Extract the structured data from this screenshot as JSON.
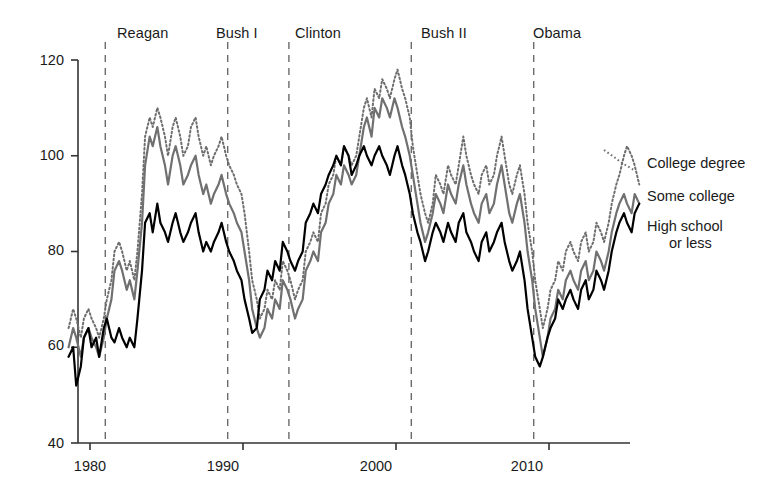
{
  "chart_data": {
    "type": "line",
    "title": "",
    "xlabel": "",
    "ylabel": "",
    "xlim": [
      1978.6,
      2016.8
    ],
    "ylim": [
      40,
      120
    ],
    "grid": false,
    "legend_position": "right",
    "x_ticks": [
      "1980",
      "1990",
      "2000",
      "2010"
    ],
    "x_tick_values": [
      1980,
      1990,
      2000,
      2010
    ],
    "y_ticks": [
      "40",
      "60",
      "80",
      "100",
      "120"
    ],
    "y_tick_values": [
      40,
      60,
      80,
      100,
      120
    ],
    "annotations": [
      {
        "label": "Reagan",
        "x": 1981.0,
        "label_x": 1984.3
      },
      {
        "label": "Bush I",
        "x": 1989.0,
        "label_x": 1990.9
      },
      {
        "label": "Clinton",
        "x": 1993.0,
        "label_x": 1996.2
      },
      {
        "label": "Bush II",
        "x": 2001.0,
        "label_x": 2004.0
      },
      {
        "label": "Obama",
        "x": 2009.0,
        "label_x": 2012.0
      }
    ],
    "series": [
      {
        "name": "College degree",
        "style": "dotted",
        "color": "#6e6e6e",
        "x": [
          1978.6,
          1978.9,
          1979.1,
          1979.4,
          1979.6,
          1979.9,
          1980.1,
          1980.4,
          1980.6,
          1980.9,
          1981.1,
          1981.4,
          1981.6,
          1981.9,
          1982.1,
          1982.4,
          1982.6,
          1982.9,
          1983.1,
          1983.4,
          1983.6,
          1983.9,
          1984.1,
          1984.4,
          1984.6,
          1984.9,
          1985.1,
          1985.4,
          1985.6,
          1985.9,
          1986.1,
          1986.4,
          1986.6,
          1986.9,
          1987.1,
          1987.4,
          1987.6,
          1987.9,
          1988.1,
          1988.4,
          1988.6,
          1988.9,
          1989.1,
          1989.4,
          1989.6,
          1989.9,
          1990.1,
          1990.4,
          1990.6,
          1990.9,
          1991.1,
          1991.4,
          1991.6,
          1991.9,
          1992.1,
          1992.4,
          1992.6,
          1992.9,
          1993.1,
          1993.4,
          1993.6,
          1993.9,
          1994.1,
          1994.4,
          1994.6,
          1994.9,
          1995.1,
          1995.4,
          1995.6,
          1995.9,
          1996.1,
          1996.4,
          1996.6,
          1996.9,
          1997.1,
          1997.4,
          1997.6,
          1997.9,
          1998.1,
          1998.4,
          1998.6,
          1998.9,
          1999.1,
          1999.4,
          1999.6,
          1999.9,
          2000.1,
          2000.4,
          2000.6,
          2000.9,
          2001.1,
          2001.4,
          2001.6,
          2001.9,
          2002.1,
          2002.4,
          2002.6,
          2002.9,
          2003.1,
          2003.4,
          2003.6,
          2003.9,
          2004.1,
          2004.4,
          2004.6,
          2004.9,
          2005.1,
          2005.4,
          2005.6,
          2005.9,
          2006.1,
          2006.4,
          2006.6,
          2006.9,
          2007.1,
          2007.4,
          2007.6,
          2007.9,
          2008.1,
          2008.4,
          2008.6,
          2008.9,
          2009.1,
          2009.4,
          2009.6,
          2009.9,
          2010.1,
          2010.4,
          2010.6,
          2010.9,
          2011.1,
          2011.4,
          2011.6,
          2011.9,
          2012.1,
          2012.4,
          2012.6,
          2012.9,
          2013.1,
          2013.4,
          2013.6,
          2013.9,
          2014.1,
          2014.4,
          2014.6,
          2014.9,
          2015.1,
          2015.4,
          2015.6,
          2015.9
        ],
        "values": [
          64,
          68,
          66,
          62,
          66,
          68,
          66,
          64,
          62,
          66,
          70,
          74,
          80,
          82,
          80,
          76,
          78,
          74,
          80,
          92,
          104,
          108,
          106,
          110,
          108,
          104,
          100,
          106,
          108,
          104,
          100,
          102,
          106,
          108,
          104,
          100,
          102,
          98,
          100,
          102,
          104,
          100,
          98,
          96,
          94,
          92,
          88,
          80,
          74,
          70,
          66,
          68,
          72,
          70,
          74,
          72,
          78,
          76,
          74,
          70,
          72,
          74,
          80,
          82,
          84,
          82,
          88,
          90,
          94,
          96,
          100,
          98,
          102,
          100,
          98,
          100,
          104,
          110,
          112,
          108,
          114,
          112,
          116,
          114,
          112,
          116,
          118,
          114,
          112,
          108,
          102,
          96,
          92,
          88,
          86,
          90,
          96,
          94,
          92,
          98,
          96,
          94,
          98,
          104,
          100,
          96,
          94,
          92,
          96,
          98,
          94,
          96,
          100,
          104,
          100,
          94,
          92,
          96,
          98,
          92,
          86,
          80,
          74,
          68,
          64,
          68,
          72,
          74,
          78,
          76,
          80,
          82,
          80,
          78,
          82,
          84,
          80,
          82,
          86,
          84,
          82,
          86,
          90,
          94,
          96,
          100,
          102,
          100,
          98,
          94
        ]
      },
      {
        "name": "Some college",
        "style": "solid",
        "color": "#707070",
        "x": [
          1978.6,
          1978.9,
          1979.1,
          1979.4,
          1979.6,
          1979.9,
          1980.1,
          1980.4,
          1980.6,
          1980.9,
          1981.1,
          1981.4,
          1981.6,
          1981.9,
          1982.1,
          1982.4,
          1982.6,
          1982.9,
          1983.1,
          1983.4,
          1983.6,
          1983.9,
          1984.1,
          1984.4,
          1984.6,
          1984.9,
          1985.1,
          1985.4,
          1985.6,
          1985.9,
          1986.1,
          1986.4,
          1986.6,
          1986.9,
          1987.1,
          1987.4,
          1987.6,
          1987.9,
          1988.1,
          1988.4,
          1988.6,
          1988.9,
          1989.1,
          1989.4,
          1989.6,
          1989.9,
          1990.1,
          1990.4,
          1990.6,
          1990.9,
          1991.1,
          1991.4,
          1991.6,
          1991.9,
          1992.1,
          1992.4,
          1992.6,
          1992.9,
          1993.1,
          1993.4,
          1993.6,
          1993.9,
          1994.1,
          1994.4,
          1994.6,
          1994.9,
          1995.1,
          1995.4,
          1995.6,
          1995.9,
          1996.1,
          1996.4,
          1996.6,
          1996.9,
          1997.1,
          1997.4,
          1997.6,
          1997.9,
          1998.1,
          1998.4,
          1998.6,
          1998.9,
          1999.1,
          1999.4,
          1999.6,
          1999.9,
          2000.1,
          2000.4,
          2000.6,
          2000.9,
          2001.1,
          2001.4,
          2001.6,
          2001.9,
          2002.1,
          2002.4,
          2002.6,
          2002.9,
          2003.1,
          2003.4,
          2003.6,
          2003.9,
          2004.1,
          2004.4,
          2004.6,
          2004.9,
          2005.1,
          2005.4,
          2005.6,
          2005.9,
          2006.1,
          2006.4,
          2006.6,
          2006.9,
          2007.1,
          2007.4,
          2007.6,
          2007.9,
          2008.1,
          2008.4,
          2008.6,
          2008.9,
          2009.1,
          2009.4,
          2009.6,
          2009.9,
          2010.1,
          2010.4,
          2010.6,
          2010.9,
          2011.1,
          2011.4,
          2011.6,
          2011.9,
          2012.1,
          2012.4,
          2012.6,
          2012.9,
          2013.1,
          2013.4,
          2013.6,
          2013.9,
          2014.1,
          2014.4,
          2014.6,
          2014.9,
          2015.1,
          2015.4,
          2015.6,
          2015.9
        ],
        "values": [
          60,
          64,
          62,
          58,
          62,
          64,
          62,
          60,
          58,
          62,
          66,
          70,
          76,
          78,
          76,
          72,
          74,
          70,
          76,
          86,
          98,
          104,
          102,
          106,
          102,
          98,
          94,
          100,
          102,
          98,
          94,
          96,
          98,
          100,
          96,
          92,
          94,
          90,
          92,
          94,
          96,
          92,
          90,
          88,
          86,
          84,
          80,
          74,
          68,
          64,
          62,
          64,
          68,
          66,
          70,
          68,
          74,
          72,
          70,
          66,
          68,
          70,
          76,
          78,
          80,
          78,
          84,
          86,
          90,
          92,
          96,
          94,
          98,
          96,
          94,
          96,
          100,
          106,
          108,
          104,
          110,
          108,
          112,
          110,
          108,
          112,
          110,
          106,
          104,
          100,
          96,
          90,
          86,
          82,
          84,
          88,
          92,
          90,
          88,
          94,
          92,
          90,
          94,
          98,
          94,
          90,
          88,
          86,
          90,
          92,
          88,
          90,
          94,
          98,
          94,
          88,
          86,
          90,
          92,
          86,
          80,
          74,
          68,
          62,
          58,
          62,
          66,
          68,
          72,
          70,
          74,
          76,
          74,
          72,
          76,
          78,
          74,
          76,
          80,
          78,
          76,
          80,
          84,
          88,
          90,
          92,
          90,
          88,
          92,
          90
        ]
      },
      {
        "name": "High school or less",
        "style": "solid",
        "color": "#000000",
        "x": [
          1978.6,
          1978.9,
          1979.1,
          1979.4,
          1979.6,
          1979.9,
          1980.1,
          1980.4,
          1980.6,
          1980.9,
          1981.1,
          1981.4,
          1981.6,
          1981.9,
          1982.1,
          1982.4,
          1982.6,
          1982.9,
          1983.1,
          1983.4,
          1983.6,
          1983.9,
          1984.1,
          1984.4,
          1984.6,
          1984.9,
          1985.1,
          1985.4,
          1985.6,
          1985.9,
          1986.1,
          1986.4,
          1986.6,
          1986.9,
          1987.1,
          1987.4,
          1987.6,
          1987.9,
          1988.1,
          1988.4,
          1988.6,
          1988.9,
          1989.1,
          1989.4,
          1989.6,
          1989.9,
          1990.1,
          1990.4,
          1990.6,
          1990.9,
          1991.1,
          1991.4,
          1991.6,
          1991.9,
          1992.1,
          1992.4,
          1992.6,
          1992.9,
          1993.1,
          1993.4,
          1993.6,
          1993.9,
          1994.1,
          1994.4,
          1994.6,
          1994.9,
          1995.1,
          1995.4,
          1995.6,
          1995.9,
          1996.1,
          1996.4,
          1996.6,
          1996.9,
          1997.1,
          1997.4,
          1997.6,
          1997.9,
          1998.1,
          1998.4,
          1998.6,
          1998.9,
          1999.1,
          1999.4,
          1999.6,
          1999.9,
          2000.1,
          2000.4,
          2000.6,
          2000.9,
          2001.1,
          2001.4,
          2001.6,
          2001.9,
          2002.1,
          2002.4,
          2002.6,
          2002.9,
          2003.1,
          2003.4,
          2003.6,
          2003.9,
          2004.1,
          2004.4,
          2004.6,
          2004.9,
          2005.1,
          2005.4,
          2005.6,
          2005.9,
          2006.1,
          2006.4,
          2006.6,
          2006.9,
          2007.1,
          2007.4,
          2007.6,
          2007.9,
          2008.1,
          2008.4,
          2008.6,
          2008.9,
          2009.1,
          2009.4,
          2009.6,
          2009.9,
          2010.1,
          2010.4,
          2010.6,
          2010.9,
          2011.1,
          2011.4,
          2011.6,
          2011.9,
          2012.1,
          2012.4,
          2012.6,
          2012.9,
          2013.1,
          2013.4,
          2013.6,
          2013.9,
          2014.1,
          2014.4,
          2014.6,
          2014.9,
          2015.1,
          2015.4,
          2015.6,
          2015.9
        ],
        "values": [
          58,
          60,
          52,
          56,
          62,
          64,
          60,
          62,
          58,
          64,
          66,
          62,
          61,
          64,
          62,
          60,
          62,
          60,
          66,
          76,
          86,
          88,
          84,
          90,
          86,
          84,
          82,
          86,
          88,
          84,
          82,
          84,
          86,
          88,
          84,
          80,
          82,
          80,
          82,
          84,
          86,
          82,
          80,
          78,
          76,
          74,
          70,
          66,
          63,
          64,
          70,
          72,
          76,
          74,
          78,
          76,
          82,
          80,
          78,
          76,
          78,
          80,
          86,
          88,
          90,
          88,
          92,
          94,
          96,
          98,
          100,
          98,
          102,
          100,
          96,
          98,
          100,
          102,
          100,
          98,
          100,
          102,
          100,
          98,
          96,
          100,
          102,
          98,
          96,
          92,
          88,
          84,
          82,
          78,
          80,
          84,
          86,
          84,
          82,
          86,
          84,
          82,
          86,
          88,
          84,
          82,
          80,
          78,
          82,
          84,
          80,
          82,
          84,
          86,
          82,
          78,
          76,
          78,
          80,
          74,
          68,
          62,
          58,
          56,
          58,
          62,
          64,
          66,
          70,
          68,
          70,
          72,
          70,
          68,
          72,
          74,
          70,
          72,
          76,
          74,
          72,
          76,
          80,
          84,
          86,
          88,
          86,
          84,
          88,
          90
        ]
      }
    ]
  },
  "axis": {
    "y_line_color": "#333333",
    "x_line_color": "#333333",
    "divider_color": "#6b6b6b"
  },
  "legend": {
    "items": [
      {
        "label": "College degree"
      },
      {
        "label": "Some college"
      },
      {
        "label_line1": "High school",
        "label_line2": "or less"
      }
    ]
  },
  "caption_fragment": ""
}
